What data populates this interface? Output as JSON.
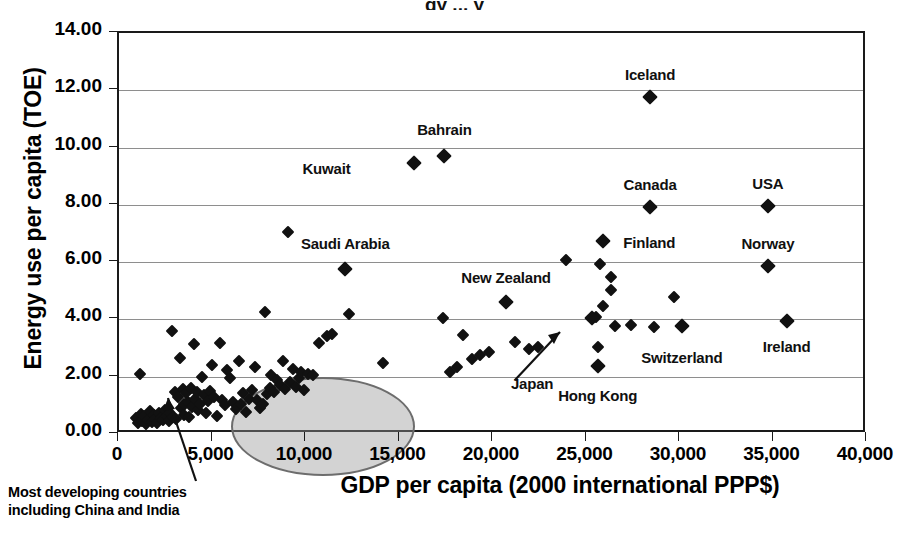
{
  "figure": {
    "title_partial": "gy ... y",
    "xaxis_title": "GDP per capita (2000 international PPP$)",
    "yaxis_title": "Energy use per capita (TOE)",
    "callout": "Most developing countries\nincluding China and India",
    "ellipse_label": "cluster-highlight-ellipse"
  },
  "chart_data": {
    "type": "scatter",
    "title": "",
    "xlabel": "GDP per capita (2000 international PPP$)",
    "ylabel": "Energy use per capita (TOE)",
    "xlim": [
      0,
      40000
    ],
    "ylim": [
      0,
      14.0
    ],
    "xticks": [
      "0",
      "5,000",
      "10,000",
      "15,000",
      "20,000",
      "25,000",
      "30,000",
      "35,000",
      "40,000"
    ],
    "xtick_values": [
      0,
      5000,
      10000,
      15000,
      20000,
      25000,
      30000,
      35000,
      40000
    ],
    "yticks": [
      "0.00",
      "2.00",
      "4.00",
      "6.00",
      "8.00",
      "10.00",
      "12.00",
      "14.00"
    ],
    "ytick_values": [
      0,
      2,
      4,
      6,
      8,
      10,
      12,
      14
    ],
    "grid": "horizontal",
    "legend": "none",
    "marker": "filled-diamond",
    "marker_color": "#111111",
    "labeled_points": [
      {
        "name": "Iceland",
        "x": 28400,
        "y": 11.75,
        "label_dx": 0,
        "label_dy": -22,
        "label_align": "center"
      },
      {
        "name": "Bahrain",
        "x": 17400,
        "y": 9.72,
        "label_dx": 0,
        "label_dy": -26,
        "label_align": "center"
      },
      {
        "name": "Kuwait",
        "x": 15800,
        "y": 9.45,
        "label_dx": -64,
        "label_dy": 6,
        "label_align": "right"
      },
      {
        "name": "Canada",
        "x": 28400,
        "y": 7.93,
        "label_dx": 0,
        "label_dy": -22,
        "label_align": "center"
      },
      {
        "name": "USA",
        "x": 34700,
        "y": 7.95,
        "label_dx": 0,
        "label_dy": -22,
        "label_align": "center"
      },
      {
        "name": "Finland",
        "x": 25900,
        "y": 6.75,
        "label_dx": 20,
        "label_dy": 2,
        "label_align": "left"
      },
      {
        "name": "Norway",
        "x": 34700,
        "y": 5.87,
        "label_dx": 0,
        "label_dy": -22,
        "label_align": "center"
      },
      {
        "name": "Saudi Arabia",
        "x": 12100,
        "y": 5.75,
        "label_dx": 0,
        "label_dy": -25,
        "label_align": "center"
      },
      {
        "name": "New Zealand",
        "x": 20700,
        "y": 4.6,
        "label_dx": 0,
        "label_dy": -24,
        "label_align": "center"
      },
      {
        "name": "Ireland",
        "x": 35700,
        "y": 3.95,
        "label_dx": 0,
        "label_dy": 26,
        "label_align": "center"
      },
      {
        "name": "Switzerland",
        "x": 30100,
        "y": 3.77,
        "label_dx": 0,
        "label_dy": 32,
        "label_align": "center"
      },
      {
        "name": "Hong Kong",
        "x": 25600,
        "y": 2.38,
        "label_dx": 0,
        "label_dy": 30,
        "label_align": "center"
      },
      {
        "name": "Japan",
        "x": 25300,
        "y": 4.05,
        "label_dx": -60,
        "label_dy": 66,
        "label_align": "center"
      }
    ],
    "points": [
      [
        900,
        0.55
      ],
      [
        1000,
        0.4
      ],
      [
        1100,
        2.1
      ],
      [
        1150,
        0.7
      ],
      [
        1250,
        0.45
      ],
      [
        1350,
        0.62
      ],
      [
        1450,
        0.35
      ],
      [
        1550,
        0.5
      ],
      [
        1650,
        0.8
      ],
      [
        1750,
        0.42
      ],
      [
        1850,
        0.66
      ],
      [
        1950,
        0.52
      ],
      [
        2050,
        0.38
      ],
      [
        2150,
        0.72
      ],
      [
        2250,
        0.55
      ],
      [
        2350,
        0.48
      ],
      [
        2450,
        0.85
      ],
      [
        2550,
        0.62
      ],
      [
        2650,
        0.44
      ],
      [
        2750,
        0.75
      ],
      [
        2850,
        3.58
      ],
      [
        2900,
        0.58
      ],
      [
        3000,
        1.45
      ],
      [
        3050,
        0.52
      ],
      [
        3150,
        1.3
      ],
      [
        3250,
        2.65
      ],
      [
        3300,
        0.92
      ],
      [
        3400,
        1.58
      ],
      [
        3450,
        1.05
      ],
      [
        3500,
        0.68
      ],
      [
        3600,
        1.42
      ],
      [
        3700,
        1.12
      ],
      [
        3750,
        0.6
      ],
      [
        3850,
        1.62
      ],
      [
        3900,
        0.95
      ],
      [
        4000,
        3.15
      ],
      [
        4050,
        1.22
      ],
      [
        4150,
        1.48
      ],
      [
        4250,
        0.85
      ],
      [
        4350,
        1.05
      ],
      [
        4450,
        2.0
      ],
      [
        4550,
        1.35
      ],
      [
        4650,
        0.72
      ],
      [
        4750,
        1.15
      ],
      [
        4850,
        1.5
      ],
      [
        4950,
        2.42
      ],
      [
        5100,
        1.28
      ],
      [
        5250,
        0.62
      ],
      [
        5400,
        3.18
      ],
      [
        5500,
        1.18
      ],
      [
        5650,
        1.02
      ],
      [
        5800,
        2.22
      ],
      [
        5950,
        1.95
      ],
      [
        6100,
        1.12
      ],
      [
        6250,
        0.88
      ],
      [
        6400,
        2.55
      ],
      [
        6500,
        1.05
      ],
      [
        6650,
        1.42
      ],
      [
        6800,
        0.78
      ],
      [
        6950,
        1.22
      ],
      [
        7100,
        1.55
      ],
      [
        7250,
        2.35
      ],
      [
        7400,
        1.18
      ],
      [
        7550,
        0.92
      ],
      [
        7700,
        1.05
      ],
      [
        7800,
        4.25
      ],
      [
        7900,
        1.38
      ],
      [
        8050,
        1.62
      ],
      [
        8150,
        2.05
      ],
      [
        8300,
        1.45
      ],
      [
        8450,
        1.88
      ],
      [
        8600,
        1.72
      ],
      [
        8750,
        2.55
      ],
      [
        8900,
        1.58
      ],
      [
        9050,
        7.05
      ],
      [
        9150,
        1.82
      ],
      [
        9300,
        2.28
      ],
      [
        9450,
        1.65
      ],
      [
        9600,
        1.95
      ],
      [
        9750,
        2.18
      ],
      [
        9900,
        1.55
      ],
      [
        10100,
        2.08
      ],
      [
        10400,
        2.05
      ],
      [
        10700,
        3.18
      ],
      [
        11100,
        3.42
      ],
      [
        11400,
        3.48
      ],
      [
        12100,
        5.75
      ],
      [
        12300,
        4.18
      ],
      [
        14100,
        2.48
      ],
      [
        17300,
        4.05
      ],
      [
        17700,
        2.15
      ],
      [
        18100,
        2.35
      ],
      [
        18400,
        3.45
      ],
      [
        18900,
        2.62
      ],
      [
        19300,
        2.75
      ],
      [
        19800,
        2.88
      ],
      [
        20700,
        4.6
      ],
      [
        21200,
        3.22
      ],
      [
        21900,
        2.98
      ],
      [
        22400,
        3.05
      ],
      [
        23900,
        6.08
      ],
      [
        25300,
        4.05
      ],
      [
        25500,
        4.08
      ],
      [
        25700,
        5.92
      ],
      [
        25900,
        6.75
      ],
      [
        25900,
        4.48
      ],
      [
        25600,
        3.05
      ],
      [
        25600,
        2.38
      ],
      [
        26300,
        5.48
      ],
      [
        26300,
        5.02
      ],
      [
        26500,
        3.78
      ],
      [
        27400,
        3.82
      ],
      [
        28400,
        11.75
      ],
      [
        28400,
        7.93
      ],
      [
        28600,
        3.72
      ],
      [
        29700,
        4.8
      ],
      [
        30100,
        3.77
      ],
      [
        34700,
        7.95
      ],
      [
        34700,
        5.87
      ],
      [
        35700,
        3.95
      ]
    ]
  }
}
